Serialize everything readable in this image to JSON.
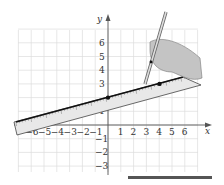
{
  "figure": {
    "x_axis_label": "x",
    "y_axis_label": "y",
    "x_ticks": [
      "-6",
      "-5",
      "-4",
      "-3",
      "-2",
      "-1",
      "1",
      "2",
      "3",
      "4",
      "5",
      "6"
    ],
    "y_ticks": [
      "6",
      "5",
      "4",
      "3",
      "1",
      "-1",
      "-2",
      "-3"
    ],
    "points": [
      {
        "x": 0,
        "y": 2
      },
      {
        "x": 4,
        "y": 3
      }
    ],
    "line": {
      "slope": 0.25,
      "intercept": 2
    }
  },
  "colors": {
    "grid": "#d8d8d8",
    "axis": "#555555",
    "line": "#111111",
    "ruler": "#e6e6e6",
    "hand": "#bdbdbd",
    "bar": "#555555"
  }
}
